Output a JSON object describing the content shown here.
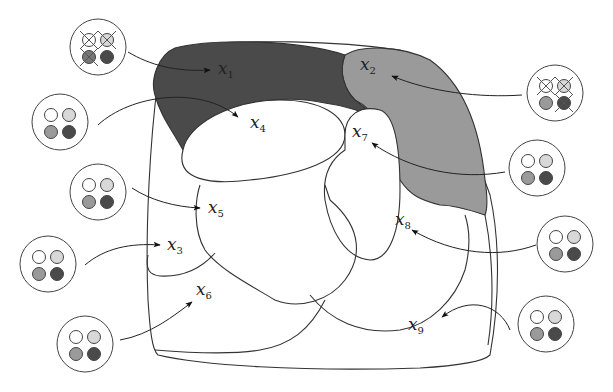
{
  "diagram": {
    "type": "partition-map",
    "colors": {
      "region_x1": "#4a4a4a",
      "region_x2": "#9a9a9a",
      "background": "#ffffff",
      "stroke": "#333333",
      "dot_white": "#ffffff",
      "dot_light": "#d8d8d8",
      "dot_mid": "#9a9a9a",
      "dot_dark": "#4a4a4a"
    },
    "labels": [
      {
        "id": "x1",
        "base": "x",
        "sub": "1"
      },
      {
        "id": "x2",
        "base": "x",
        "sub": "2"
      },
      {
        "id": "x3",
        "base": "x",
        "sub": "3"
      },
      {
        "id": "x4",
        "base": "x",
        "sub": "4"
      },
      {
        "id": "x5",
        "base": "x",
        "sub": "5"
      },
      {
        "id": "x6",
        "base": "x",
        "sub": "6"
      },
      {
        "id": "x7",
        "base": "x",
        "sub": "7"
      },
      {
        "id": "x8",
        "base": "x",
        "sub": "8"
      },
      {
        "id": "x9",
        "base": "x",
        "sub": "9"
      }
    ],
    "legend_circles": [
      {
        "target": "x1",
        "dots": [
          "white-crossed",
          "light-crossed",
          "mid-crossed",
          "dark"
        ]
      },
      {
        "target": "x2",
        "dots": [
          "white-crossed",
          "light-crossed",
          "mid",
          "dark-crossed"
        ]
      },
      {
        "target": "x4",
        "dots": [
          "white",
          "light",
          "mid",
          "dark"
        ]
      },
      {
        "target": "x5",
        "dots": [
          "white",
          "light",
          "mid",
          "dark"
        ]
      },
      {
        "target": "x3",
        "dots": [
          "white",
          "light",
          "mid",
          "dark"
        ]
      },
      {
        "target": "x6",
        "dots": [
          "white",
          "light",
          "mid",
          "dark"
        ]
      },
      {
        "target": "x7",
        "dots": [
          "white",
          "light",
          "mid",
          "dark"
        ]
      },
      {
        "target": "x8",
        "dots": [
          "white",
          "light",
          "mid",
          "dark"
        ]
      },
      {
        "target": "x9",
        "dots": [
          "white",
          "light",
          "mid",
          "dark"
        ]
      }
    ]
  }
}
